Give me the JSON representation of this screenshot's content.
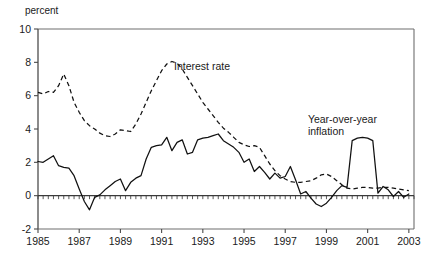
{
  "chart_data": {
    "type": "line",
    "title": "",
    "subtitle": "",
    "ylabel": "percent",
    "xlabel": "",
    "ylim": [
      -2,
      10
    ],
    "xlim": [
      1985,
      2003.25
    ],
    "grid": false,
    "legend_position": "inline-annotation",
    "y_ticks": [
      "10",
      "8",
      "6",
      "4",
      "2",
      "0",
      "-2"
    ],
    "y_tick_values": [
      10,
      8,
      6,
      4,
      2,
      0,
      -2
    ],
    "x_ticks": [
      "1985",
      "1987",
      "1989",
      "1991",
      "1993",
      "1995",
      "1997",
      "1999",
      "2001",
      "2003"
    ],
    "x_tick_values": [
      1985,
      1987,
      1989,
      1991,
      1993,
      1995,
      1997,
      1999,
      2001,
      2003
    ],
    "annotations": [
      {
        "name": "interest-rate-label",
        "text": "Interest rate",
        "x": 1991.6,
        "y": 7.55
      },
      {
        "name": "inflation-label-line1",
        "text": "Year-over-year",
        "x": 1998.1,
        "y": 4.35
      },
      {
        "name": "inflation-label-line2",
        "text": "inflation",
        "x": 1998.1,
        "y": 3.65
      }
    ],
    "series": [
      {
        "name": "Interest rate",
        "style": "dashed",
        "color": "#111111",
        "x": [
          1985.0,
          1985.25,
          1985.5,
          1985.75,
          1986.0,
          1986.25,
          1986.5,
          1986.75,
          1987.0,
          1987.25,
          1987.5,
          1987.75,
          1988.0,
          1988.25,
          1988.5,
          1988.75,
          1989.0,
          1989.25,
          1989.5,
          1989.75,
          1990.0,
          1990.25,
          1990.5,
          1990.75,
          1991.0,
          1991.25,
          1991.5,
          1991.75,
          1992.0,
          1992.25,
          1992.5,
          1992.75,
          1993.0,
          1993.25,
          1993.5,
          1993.75,
          1994.0,
          1994.25,
          1994.5,
          1994.75,
          1995.0,
          1995.25,
          1995.5,
          1995.75,
          1996.0,
          1996.25,
          1996.5,
          1996.75,
          1997.0,
          1997.25,
          1997.5,
          1997.75,
          1998.0,
          1998.25,
          1998.5,
          1998.75,
          1999.0,
          1999.25,
          1999.5,
          1999.75,
          2000.0,
          2000.25,
          2000.5,
          2000.75,
          2001.0,
          2001.25,
          2001.5,
          2001.75,
          2002.0,
          2002.25,
          2002.5,
          2002.75,
          2003.0
        ],
        "values": [
          6.2,
          6.1,
          6.25,
          6.2,
          6.6,
          7.3,
          6.6,
          5.6,
          5.0,
          4.5,
          4.2,
          4.0,
          3.75,
          3.6,
          3.55,
          3.7,
          3.95,
          3.9,
          3.85,
          4.3,
          4.9,
          5.6,
          6.3,
          6.9,
          7.5,
          7.9,
          8.05,
          7.95,
          7.6,
          7.1,
          6.6,
          6.1,
          5.6,
          5.2,
          4.8,
          4.4,
          4.05,
          3.8,
          3.5,
          3.2,
          3.05,
          2.95,
          3.0,
          2.9,
          2.4,
          1.9,
          1.5,
          1.2,
          1.0,
          0.85,
          0.8,
          0.8,
          0.85,
          0.9,
          1.05,
          1.25,
          1.3,
          1.15,
          0.9,
          0.65,
          0.45,
          0.4,
          0.45,
          0.5,
          0.5,
          0.45,
          0.45,
          0.5,
          0.5,
          0.45,
          0.4,
          0.35,
          0.3
        ]
      },
      {
        "name": "Year-over-year inflation",
        "style": "solid",
        "color": "#111111",
        "x": [
          1985.0,
          1985.25,
          1985.5,
          1985.75,
          1986.0,
          1986.25,
          1986.5,
          1986.75,
          1987.0,
          1987.25,
          1987.5,
          1987.75,
          1988.0,
          1988.25,
          1988.5,
          1988.75,
          1989.0,
          1989.25,
          1989.5,
          1989.75,
          1990.0,
          1990.25,
          1990.5,
          1990.75,
          1991.0,
          1991.25,
          1991.5,
          1991.75,
          1992.0,
          1992.25,
          1992.5,
          1992.75,
          1993.0,
          1993.25,
          1993.5,
          1993.75,
          1994.0,
          1994.25,
          1994.5,
          1994.75,
          1995.0,
          1995.25,
          1995.5,
          1995.75,
          1996.0,
          1996.25,
          1996.5,
          1996.75,
          1997.0,
          1997.25,
          1997.5,
          1997.75,
          1998.0,
          1998.25,
          1998.5,
          1998.75,
          1999.0,
          1999.25,
          1999.5,
          1999.75,
          2000.0,
          2000.25,
          2000.5,
          2000.75,
          2001.0,
          2001.25,
          2001.5,
          2001.75,
          2002.0,
          2002.25,
          2002.5,
          2002.75,
          2003.0
        ],
        "values": [
          2.05,
          2.0,
          2.2,
          2.4,
          1.8,
          1.7,
          1.65,
          1.2,
          0.4,
          -0.35,
          -0.85,
          -0.1,
          0.05,
          0.35,
          0.6,
          0.85,
          1.0,
          0.3,
          0.8,
          1.05,
          1.2,
          2.2,
          2.9,
          3.0,
          3.05,
          3.5,
          2.7,
          3.2,
          3.35,
          2.5,
          2.6,
          3.35,
          3.45,
          3.5,
          3.6,
          3.7,
          3.3,
          3.1,
          2.9,
          2.6,
          2.0,
          2.2,
          1.45,
          1.75,
          1.4,
          1.0,
          1.35,
          1.05,
          1.15,
          1.75,
          0.95,
          0.1,
          0.25,
          -0.15,
          -0.5,
          -0.65,
          -0.45,
          -0.1,
          0.3,
          0.6,
          0.5,
          3.3,
          3.45,
          3.5,
          3.45,
          3.3,
          0.15,
          0.55,
          0.35,
          -0.05,
          0.25,
          -0.1,
          0.1
        ]
      }
    ]
  }
}
